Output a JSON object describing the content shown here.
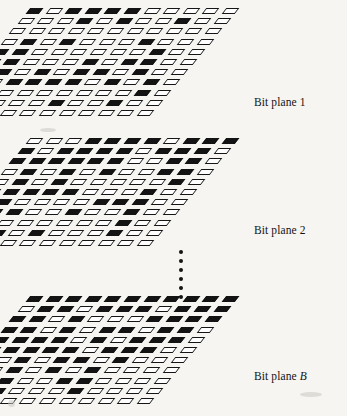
{
  "figure": {
    "background_color": "#f6f5f2",
    "ink_color": "#131313",
    "cell_fill_on": "#131313",
    "cell_fill_off": "#ffffff",
    "width": 347,
    "height": 416
  },
  "ellipsis": {
    "name": "vertical-ellipsis",
    "dot_count": 6,
    "meaning": "planes 3 through B-1 omitted"
  },
  "planes": [
    {
      "id": "plane-1",
      "label_prefix": "Bit plane",
      "label_suffix": "1",
      "label_full": "Bit plane 1",
      "label_x": 254,
      "label_y": 96,
      "origin_x": 28,
      "origin_y": 8,
      "rows": 11,
      "cols": 11,
      "col_pitch_x": 19.6,
      "col_pitch_y": 0,
      "row_pitch_x": -8.5,
      "row_pitch_y": 10.2,
      "bits": [
        [
          1,
          0,
          1,
          1,
          1,
          1,
          0,
          0,
          0,
          0,
          0
        ],
        [
          0,
          0,
          0,
          1,
          0,
          1,
          0,
          0,
          1,
          0,
          0
        ],
        [
          0,
          0,
          0,
          0,
          0,
          0,
          0,
          0,
          0,
          0,
          0
        ],
        [
          0,
          1,
          0,
          1,
          0,
          0,
          0,
          1,
          0,
          0,
          0
        ],
        [
          1,
          1,
          0,
          0,
          0,
          0,
          0,
          0,
          1,
          0,
          0
        ],
        [
          1,
          1,
          0,
          0,
          0,
          1,
          0,
          1,
          1,
          0,
          0
        ],
        [
          0,
          1,
          0,
          1,
          0,
          1,
          1,
          0,
          1,
          0,
          0
        ],
        [
          1,
          0,
          1,
          1,
          1,
          1,
          0,
          1,
          0,
          1,
          0
        ],
        [
          0,
          0,
          0,
          0,
          0,
          0,
          0,
          0,
          0,
          1,
          0
        ],
        [
          0,
          0,
          0,
          0,
          0,
          1,
          0,
          0,
          1,
          0,
          0
        ],
        [
          0,
          0,
          0,
          0,
          0,
          0,
          0,
          0,
          0,
          0,
          0
        ]
      ]
    },
    {
      "id": "plane-2",
      "label_prefix": "Bit plane",
      "label_suffix": "2",
      "label_full": "Bit plane 2",
      "label_x": 254,
      "label_y": 224,
      "origin_x": 28,
      "origin_y": 138,
      "rows": 11,
      "cols": 11,
      "col_pitch_x": 19.6,
      "col_pitch_y": 0,
      "row_pitch_x": -8.5,
      "row_pitch_y": 10.2,
      "bits": [
        [
          0,
          0,
          0,
          1,
          1,
          1,
          1,
          0,
          1,
          1,
          1
        ],
        [
          1,
          0,
          1,
          1,
          1,
          1,
          0,
          1,
          1,
          1,
          0
        ],
        [
          1,
          1,
          1,
          1,
          1,
          1,
          0,
          0,
          1,
          1,
          0
        ],
        [
          0,
          1,
          0,
          1,
          0,
          1,
          0,
          0,
          1,
          1,
          0
        ],
        [
          0,
          1,
          0,
          1,
          0,
          0,
          0,
          0,
          0,
          1,
          0
        ],
        [
          0,
          1,
          1,
          1,
          1,
          0,
          0,
          0,
          1,
          0,
          0
        ],
        [
          0,
          1,
          0,
          0,
          0,
          0,
          1,
          1,
          1,
          0,
          0
        ],
        [
          1,
          1,
          1,
          0,
          0,
          1,
          0,
          0,
          1,
          0,
          0
        ],
        [
          0,
          1,
          0,
          0,
          0,
          0,
          0,
          0,
          1,
          0,
          0
        ],
        [
          0,
          1,
          1,
          0,
          1,
          0,
          0,
          0,
          1,
          0,
          0
        ],
        [
          0,
          0,
          0,
          0,
          0,
          0,
          0,
          0,
          0,
          0,
          0
        ]
      ]
    },
    {
      "id": "plane-B",
      "label_prefix": "Bit plane",
      "label_suffix": "B",
      "label_full": "Bit plane B",
      "label_italic_suffix": true,
      "label_x": 254,
      "label_y": 370,
      "origin_x": 28,
      "origin_y": 296,
      "rows": 11,
      "cols": 11,
      "col_pitch_x": 19.6,
      "col_pitch_y": 0,
      "row_pitch_x": -8.5,
      "row_pitch_y": 10.2,
      "bits": [
        [
          1,
          1,
          1,
          1,
          1,
          1,
          1,
          1,
          1,
          1,
          1
        ],
        [
          0,
          1,
          1,
          0,
          1,
          1,
          1,
          0,
          1,
          1,
          1
        ],
        [
          1,
          1,
          0,
          1,
          0,
          0,
          0,
          1,
          1,
          1,
          1
        ],
        [
          1,
          1,
          0,
          1,
          0,
          1,
          1,
          0,
          1,
          1,
          0
        ],
        [
          1,
          1,
          1,
          1,
          0,
          1,
          0,
          1,
          1,
          1,
          0
        ],
        [
          1,
          1,
          1,
          1,
          1,
          0,
          1,
          1,
          1,
          0,
          0
        ],
        [
          0,
          0,
          1,
          0,
          1,
          1,
          0,
          1,
          0,
          0,
          0
        ],
        [
          0,
          0,
          1,
          0,
          1,
          0,
          1,
          0,
          0,
          0,
          0
        ],
        [
          0,
          0,
          1,
          0,
          0,
          1,
          1,
          0,
          0,
          0,
          0
        ],
        [
          0,
          0,
          1,
          0,
          0,
          0,
          1,
          0,
          0,
          0,
          0
        ],
        [
          0,
          0,
          0,
          0,
          0,
          0,
          0,
          0,
          0,
          0,
          0
        ]
      ]
    }
  ],
  "artifacts": [
    {
      "x": 8,
      "y": 400,
      "w": 7,
      "h": 7
    },
    {
      "x": 300,
      "y": 392,
      "w": 22,
      "h": 5
    },
    {
      "x": 40,
      "y": 128,
      "w": 16,
      "h": 4
    }
  ]
}
